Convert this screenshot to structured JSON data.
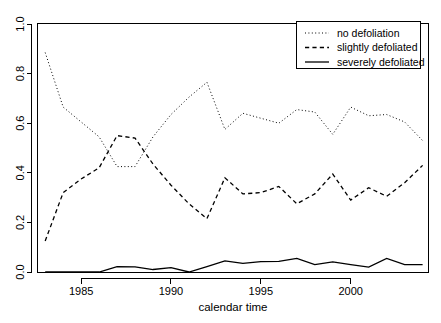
{
  "chart_data": {
    "type": "line",
    "title": "",
    "xlabel": "calendar time",
    "ylabel": "",
    "xlim": [
      1982.6,
      2004.3
    ],
    "ylim": [
      0.0,
      1.0
    ],
    "grid": false,
    "legend_position": "top-right",
    "x_ticks": [
      1985,
      1990,
      1995,
      2000
    ],
    "x_tick_labels": [
      "1985",
      "1990",
      "1995",
      "2000"
    ],
    "y_ticks": [
      0.0,
      0.2,
      0.4,
      0.6,
      0.8,
      1.0
    ],
    "y_tick_labels": [
      "0.0",
      "0.2",
      "0.4",
      "0.6",
      "0.8",
      "1.0"
    ],
    "x": [
      1983,
      1984,
      1985,
      1986,
      1987,
      1988,
      1989,
      1990,
      1991,
      1992,
      1993,
      1994,
      1995,
      1996,
      1997,
      1998,
      1999,
      2000,
      2001,
      2002,
      2003,
      2004
    ],
    "series": [
      {
        "name": "no defoliation",
        "style": "dotted",
        "color": "#000000",
        "values": [
          0.885,
          0.665,
          0.605,
          0.545,
          0.425,
          0.425,
          0.545,
          0.635,
          0.705,
          0.765,
          0.575,
          0.64,
          0.62,
          0.6,
          0.655,
          0.645,
          0.555,
          0.665,
          0.63,
          0.635,
          0.605,
          0.53
        ]
      },
      {
        "name": "slightly defoliated",
        "style": "dashed",
        "color": "#000000",
        "values": [
          0.125,
          0.32,
          0.375,
          0.42,
          0.55,
          0.54,
          0.435,
          0.35,
          0.275,
          0.215,
          0.38,
          0.315,
          0.32,
          0.345,
          0.275,
          0.315,
          0.395,
          0.29,
          0.34,
          0.305,
          0.36,
          0.43
        ]
      },
      {
        "name": "severely defoliated",
        "style": "solid",
        "color": "#000000",
        "values": [
          0.0,
          0.0,
          0.0,
          0.0,
          0.022,
          0.021,
          0.01,
          0.018,
          0.0,
          0.022,
          0.045,
          0.035,
          0.042,
          0.043,
          0.055,
          0.03,
          0.041,
          0.03,
          0.02,
          0.055,
          0.03,
          0.03
        ]
      }
    ]
  },
  "axes": {
    "x_axis_title": "calendar time",
    "x_tick_labels": [
      "1985",
      "1990",
      "1995",
      "2000"
    ],
    "y_tick_labels": [
      "0.0",
      "0.2",
      "0.4",
      "0.6",
      "0.8",
      "1.0"
    ]
  },
  "legend": {
    "items": [
      {
        "label": "no defoliation",
        "style": "dotted"
      },
      {
        "label": "slightly defoliated",
        "style": "dashed"
      },
      {
        "label": "severely defoliated",
        "style": "solid"
      }
    ]
  }
}
